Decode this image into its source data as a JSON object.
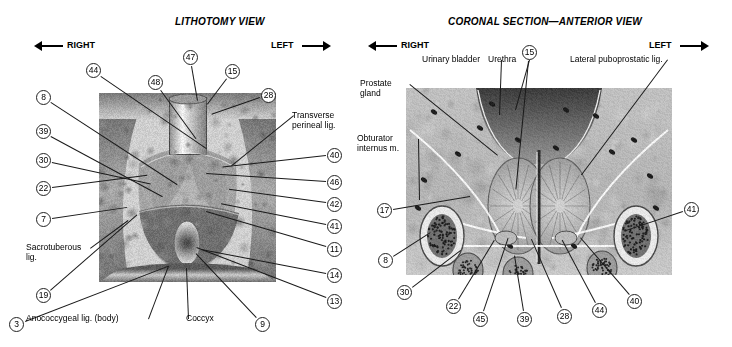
{
  "figure": {
    "kind": "anatomy-plate",
    "panels": [
      {
        "id": "lithotomy",
        "title": "LITHOTOMY VIEW",
        "orientation": {
          "left_label": "RIGHT",
          "right_label": "LEFT"
        },
        "numbered_labels": [
          {
            "num": "44",
            "x": 86,
            "y": 63,
            "tx": 207,
            "ty": 148
          },
          {
            "num": "47",
            "x": 183,
            "y": 50,
            "tx": 198,
            "ty": 101
          },
          {
            "num": "48",
            "x": 148,
            "y": 75,
            "tx": 196,
            "ty": 138
          },
          {
            "num": "15",
            "x": 225,
            "y": 64,
            "tx": 208,
            "ty": 104
          },
          {
            "num": "28",
            "x": 261,
            "y": 88,
            "tx": 212,
            "ty": 115
          },
          {
            "num": "8",
            "x": 36,
            "y": 90,
            "tx": 178,
            "ty": 185
          },
          {
            "num": "39",
            "x": 36,
            "y": 124,
            "tx": 163,
            "ty": 196
          },
          {
            "num": "30",
            "x": 36,
            "y": 153,
            "tx": 151,
            "ty": 184
          },
          {
            "num": "22",
            "x": 36,
            "y": 181,
            "tx": 148,
            "ty": 175
          },
          {
            "num": "7",
            "x": 36,
            "y": 212,
            "tx": 128,
            "ty": 207
          },
          {
            "num": "19",
            "x": 36,
            "y": 288,
            "tx": 137,
            "ty": 214
          },
          {
            "num": "40",
            "x": 327,
            "y": 148,
            "tx": 222,
            "ty": 168
          },
          {
            "num": "46",
            "x": 327,
            "y": 175,
            "tx": 206,
            "ty": 174
          },
          {
            "num": "42",
            "x": 327,
            "y": 197,
            "tx": 228,
            "ty": 190
          },
          {
            "num": "41",
            "x": 327,
            "y": 219,
            "tx": 221,
            "ty": 204
          },
          {
            "num": "11",
            "x": 327,
            "y": 242,
            "tx": 206,
            "ty": 212
          },
          {
            "num": "14",
            "x": 327,
            "y": 268,
            "tx": 202,
            "ty": 250
          },
          {
            "num": "13",
            "x": 327,
            "y": 294,
            "tx": 196,
            "ty": 248
          },
          {
            "num": "9",
            "x": 255,
            "y": 317,
            "tx": 196,
            "ty": 254
          },
          {
            "num": "3",
            "x": 9,
            "y": 317,
            "tx": 168,
            "ty": 266
          }
        ],
        "text_labels": [
          {
            "text": "Transverse perineal lig.",
            "x": 292,
            "y": 110,
            "tx": 232,
            "ty": 166,
            "width": 64
          },
          {
            "text": "Sacrotuberous lig.",
            "x": 26,
            "y": 242,
            "tx": 128,
            "ty": 220,
            "width": 62
          },
          {
            "text": "Anococcygeal lig. (body)",
            "x": 26,
            "y": 313,
            "tx": 168,
            "ty": 266,
            "width": 120
          },
          {
            "text": "Coccyx",
            "x": 186,
            "y": 313,
            "tx": 186,
            "ty": 268,
            "width": 40
          }
        ]
      },
      {
        "id": "coronal",
        "title": "CORONAL SECTION—ANTERIOR VIEW",
        "orientation": {
          "left_label": "RIGHT",
          "right_label": "LEFT"
        },
        "numbered_labels": [
          {
            "num": "15",
            "x": 522,
            "y": 45,
            "tx": 516,
            "ty": 190
          },
          {
            "num": "17",
            "x": 377,
            "y": 203,
            "tx": 470,
            "ty": 196
          },
          {
            "num": "8",
            "x": 378,
            "y": 253,
            "tx": 430,
            "ty": 232
          },
          {
            "num": "30",
            "x": 397,
            "y": 285,
            "tx": 460,
            "ty": 250
          },
          {
            "num": "22",
            "x": 446,
            "y": 299,
            "tx": 494,
            "ty": 240
          },
          {
            "num": "45",
            "x": 473,
            "y": 312,
            "tx": 508,
            "ty": 238
          },
          {
            "num": "39",
            "x": 517,
            "y": 312,
            "tx": 514,
            "ty": 255
          },
          {
            "num": "28",
            "x": 557,
            "y": 309,
            "tx": 531,
            "ty": 240
          },
          {
            "num": "44",
            "x": 592,
            "y": 303,
            "tx": 562,
            "ty": 240
          },
          {
            "num": "40",
            "x": 627,
            "y": 294,
            "tx": 580,
            "ty": 238
          },
          {
            "num": "41",
            "x": 684,
            "y": 202,
            "tx": 624,
            "ty": 232
          }
        ],
        "text_labels": [
          {
            "text": "Urinary bladder",
            "x": 422,
            "y": 54,
            "tx": 500,
            "ty": 115,
            "width": 78
          },
          {
            "text": "Urethra",
            "x": 488,
            "y": 54,
            "tx": 516,
            "ty": 110,
            "width": 40
          },
          {
            "text": "Lateral puboprostatic lig.",
            "x": 570,
            "y": 54,
            "tx": 582,
            "ty": 175,
            "width": 96
          },
          {
            "text": "Prostate gland",
            "x": 360,
            "y": 78,
            "tx": 498,
            "ty": 155,
            "width": 48
          },
          {
            "text": "Obturator internus m.",
            "x": 357,
            "y": 133,
            "tx": 420,
            "ty": 200,
            "width": 60
          }
        ]
      }
    ]
  }
}
